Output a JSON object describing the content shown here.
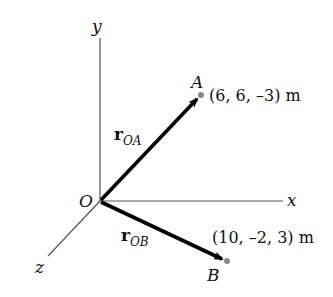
{
  "axes": {
    "x_label": "x",
    "y_label": "y",
    "z_label": "z",
    "origin_label": "O"
  },
  "points": [
    {
      "name": "A",
      "coords_text": "(6, 6, –3) m",
      "x": 6,
      "y": 6,
      "z": -3,
      "unit": "m"
    },
    {
      "name": "B",
      "coords_text": "(10, –2, 3) m",
      "x": 10,
      "y": -2,
      "z": 3,
      "unit": "m"
    }
  ],
  "vectors": [
    {
      "symbol": "r",
      "subscript": "OA",
      "from": "O",
      "to": "A"
    },
    {
      "symbol": "r",
      "subscript": "OB",
      "from": "O",
      "to": "B"
    }
  ],
  "colors": {
    "axis": "#555555",
    "vector": "#000000",
    "point": "#888888",
    "text": "#111111"
  }
}
